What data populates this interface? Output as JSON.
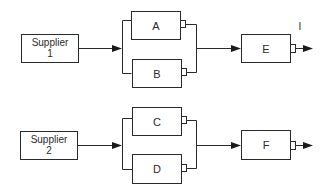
{
  "diagram": {
    "type": "block-diagram",
    "stroke_color": "#2a2a2a",
    "groups": [
      {
        "supplier": {
          "line1": "Supplier",
          "line2": "1"
        },
        "parallel_blocks": [
          "A",
          "B"
        ],
        "output_block": "E",
        "output_marker": "I"
      },
      {
        "supplier": {
          "line1": "Supplier",
          "line2": "2"
        },
        "parallel_blocks": [
          "C",
          "D"
        ],
        "output_block": "F"
      }
    ]
  }
}
